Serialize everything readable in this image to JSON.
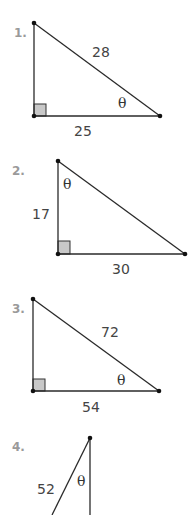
{
  "problems": [
    {
      "number": "1.",
      "hypotenuse": "28",
      "adjacent": "25",
      "angle": "θ"
    },
    {
      "number": "2.",
      "side_vertical": "17",
      "side_horizontal": "30",
      "angle": "θ"
    },
    {
      "number": "3.",
      "hypotenuse": "72",
      "adjacent": "54",
      "angle": "θ"
    },
    {
      "number": "4.",
      "hypotenuse": "52",
      "angle": "θ"
    }
  ],
  "colors": {
    "line": "#2a2a2a",
    "number": "#9a9a9a",
    "right_angle_fill": "#c8c8c8"
  }
}
